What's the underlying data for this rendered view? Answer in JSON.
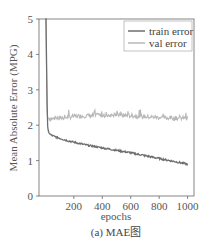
{
  "chart_data": {
    "type": "line",
    "title": "",
    "caption": "(a) MAE图",
    "xlabel": "epochs",
    "ylabel": "Mean Absolute Error (MPG)",
    "xlim": [
      -45,
      1045
    ],
    "ylim": [
      0,
      5
    ],
    "xticks": [
      200,
      400,
      600,
      800,
      1000
    ],
    "yticks": [
      0,
      1,
      2,
      3,
      4,
      5
    ],
    "grid": false,
    "legend_position": "upper right",
    "series": [
      {
        "name": "train error",
        "color": "#6e6e6e",
        "x": [
          0,
          5,
          10,
          15,
          20,
          30,
          50,
          100,
          150,
          200,
          300,
          400,
          500,
          600,
          700,
          800,
          900,
          1000
        ],
        "y": [
          5.0,
          5.0,
          3.0,
          2.0,
          1.85,
          1.75,
          1.7,
          1.63,
          1.57,
          1.52,
          1.43,
          1.36,
          1.29,
          1.22,
          1.14,
          1.06,
          0.98,
          0.9
        ]
      },
      {
        "name": "val error",
        "color": "#b8b8b8",
        "x": [
          0,
          5,
          10,
          15,
          20,
          50,
          100,
          150,
          200,
          300,
          400,
          500,
          600,
          700,
          800,
          900,
          1000
        ],
        "y": [
          5.0,
          5.0,
          2.5,
          2.2,
          2.2,
          2.18,
          2.2,
          2.22,
          2.25,
          2.27,
          2.28,
          2.29,
          2.27,
          2.24,
          2.22,
          2.2,
          2.2
        ]
      }
    ]
  }
}
